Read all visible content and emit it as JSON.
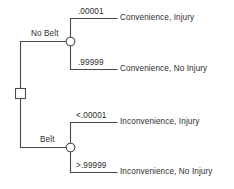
{
  "diagram": {
    "type": "decision-tree",
    "title": "",
    "nodes": {
      "decision": {
        "shape": "square",
        "label": ""
      },
      "chance_top": {
        "shape": "circle",
        "label": ""
      },
      "chance_bottom": {
        "shape": "circle",
        "label": ""
      }
    },
    "branches": [
      {
        "id": "no-belt",
        "label": "No Belt"
      },
      {
        "id": "belt",
        "label": "Belt"
      }
    ],
    "outcomes": [
      {
        "id": "convenience-injury",
        "probability": ".00001",
        "label": "Convenience, Injury"
      },
      {
        "id": "convenience-no-injury",
        "probability": ".99999",
        "label": "Convenience, No Injury"
      },
      {
        "id": "inconvenience-injury",
        "probability": "<.00001",
        "label": "Inconvenience, Injury"
      },
      {
        "id": "inconvenience-no-injury",
        "probability": ">.99999",
        "label": "Inconvenience, No Injury"
      }
    ],
    "colors": {
      "line": "#4a4a4a",
      "text": "#2e2e2e",
      "background": "#ffffff"
    }
  }
}
